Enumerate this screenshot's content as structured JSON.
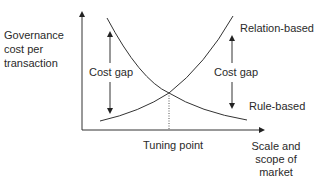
{
  "diagram": {
    "y_axis_label": [
      "Governance",
      "cost per",
      "transaction"
    ],
    "x_axis_label": [
      "Scale and",
      "scope of",
      "market"
    ],
    "curves": [
      {
        "name": "Relation-based",
        "trend": "increasing"
      },
      {
        "name": "Rule-based",
        "trend": "decreasing"
      }
    ],
    "annotations": {
      "cost_gap_left": "Cost gap",
      "cost_gap_right": "Cost gap",
      "tuning_point": "Tuning point"
    },
    "colors": {
      "line": "#333333",
      "text": "#2a2a2a",
      "background": "#ffffff"
    }
  }
}
